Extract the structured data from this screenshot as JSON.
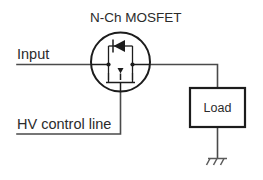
{
  "diagram": {
    "title": "N-Ch MOSFET",
    "labels": {
      "input": "Input",
      "hv_control": "HV control line",
      "load": "Load"
    },
    "components": [
      {
        "name": "n-ch-mosfet",
        "symbol": "n-channel-mosfet-in-circle-with-body-diode",
        "label": "N-Ch MOSFET"
      },
      {
        "name": "load",
        "symbol": "rectangular-block",
        "label": "Load"
      },
      {
        "name": "ground",
        "symbol": "chassis-ground",
        "label": ""
      }
    ],
    "nets": [
      {
        "name": "input-net",
        "from": "input-terminal",
        "to": "mosfet-drain"
      },
      {
        "name": "output-net",
        "from": "mosfet-source",
        "to": "load-top"
      },
      {
        "name": "gate-net",
        "from": "mosfet-gate",
        "to": "hv-control-terminal"
      },
      {
        "name": "ground-net",
        "from": "load-bottom",
        "to": "ground"
      }
    ],
    "colors": {
      "wire": "#4a4a4a",
      "symbol": "#1c1c1c",
      "text": "#2b2b2b",
      "background": "#ffffff"
    }
  }
}
